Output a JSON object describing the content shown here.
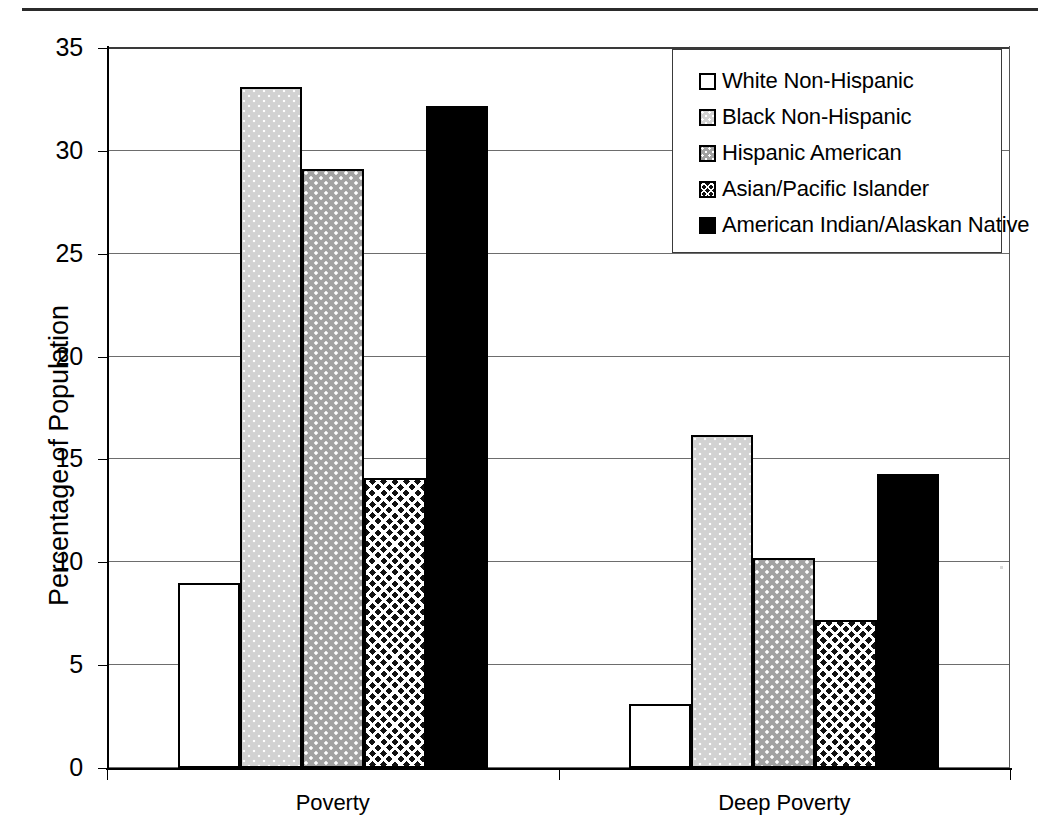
{
  "chart_data": {
    "type": "bar",
    "title": "",
    "subtitle": "",
    "xlabel": "",
    "ylabel": "Percentage of Population",
    "categories": [
      "Poverty",
      "Deep Poverty"
    ],
    "ylim": [
      0,
      35
    ],
    "ytick_step": 5,
    "yticks": [
      0,
      5,
      10,
      15,
      20,
      25,
      30,
      35
    ],
    "ytick_labels": [
      "0",
      "5",
      "10",
      "15",
      "20",
      "25",
      "30",
      "35"
    ],
    "grid": true,
    "grid_axis": "y",
    "legend_position": "top-right",
    "series": [
      {
        "name": "White Non-Hispanic",
        "values": [
          9.0,
          3.1
        ],
        "pattern": "white-empty",
        "fill_class": "fill-white",
        "color": "#ffffff"
      },
      {
        "name": "Black Non-Hispanic",
        "values": [
          33.1,
          16.2
        ],
        "pattern": "light-gray-dotted",
        "fill_class": "fill-ltgray",
        "color": "#d2d2d2"
      },
      {
        "name": "Hispanic American",
        "values": [
          29.1,
          10.2
        ],
        "pattern": "medium-gray-dotted",
        "fill_class": "fill-mdgray",
        "color": "#a2a2a2"
      },
      {
        "name": "Asian/Pacific Islander",
        "values": [
          14.1,
          7.2
        ],
        "pattern": "dark-crosshatch-weave",
        "fill_class": "fill-weave",
        "color": "#111111"
      },
      {
        "name": "American Indian/Alaskan Native",
        "values": [
          32.2,
          14.3
        ],
        "pattern": "solid-black",
        "fill_class": "fill-black",
        "color": "#000000"
      }
    ]
  },
  "axis": {
    "y_title": "Percentage of Population"
  }
}
